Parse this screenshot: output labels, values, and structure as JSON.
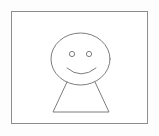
{
  "canvas": {
    "width": 159,
    "height": 136,
    "background_color": "#fdfdfd",
    "title": "Smiley Face Figure Drawing"
  },
  "frame": {
    "label": "Drawing border frame",
    "x": 11.5,
    "y": 11.5,
    "width": 136,
    "height": 112,
    "fill_color": "#ffffff",
    "stroke_color": "#8d8d8d",
    "stroke_width": 1
  },
  "figure": {
    "label": "Stick figure with smiley face",
    "stroke_color": "#7d7d7d",
    "stroke_width": 1,
    "head": {
      "label": "Head ellipse",
      "cx": 80.5,
      "cy": 59,
      "rx": 29.5,
      "ry": 26
    },
    "left_eye": {
      "label": "Left eye",
      "cx": 72,
      "cy": 54,
      "r": 2.6
    },
    "right_eye": {
      "label": "Right eye",
      "cx": 89,
      "cy": 54,
      "r": 2.6
    },
    "mouth": {
      "label": "Smile curve",
      "path": "M 67 68 Q 81 80 96 68"
    },
    "body": {
      "label": "Trapezoid body",
      "path": "M 67 82 L 53 112 L 109 112 L 95 82"
    }
  },
  "accessibility": {
    "description": "A simple hand-drawn style smiley face figure inside a rectangular frame. The figure has an oval head with two round eyes, a curved smiling mouth, and a trapezoid shaped body below the head."
  }
}
